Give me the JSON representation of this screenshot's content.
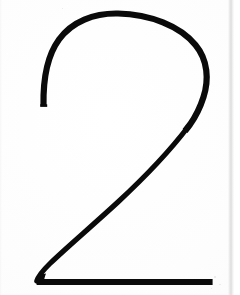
{
  "image": {
    "kind": "scanned-glyph",
    "subject": "numeral-two",
    "character": "2",
    "canvas": {
      "width": 240,
      "height": 295
    },
    "background_color": "#fdfdfd",
    "stroke_color": "#0a0a0a",
    "seam_color": "#dedede",
    "alt_text": "2"
  },
  "glyph": {
    "label": "2",
    "bounds": {
      "left": 36,
      "top": 13,
      "right": 213,
      "bottom": 285
    },
    "stroke_width_top": 6,
    "stroke_width_diagonal": 5,
    "stroke_width_baseline": 6,
    "arc_apex_y": 15,
    "bowl_right_extent_x": 207,
    "left_terminal": {
      "x": 43,
      "y": 105
    },
    "inflection": {
      "x": 200,
      "y": 125
    },
    "baseline": {
      "y": 282,
      "start_x": 36,
      "end_x": 213
    }
  },
  "artifacts": {
    "scan_seam_x": 228,
    "scan_seam_width": 6,
    "right_margin_x": 234,
    "left_edge_width": 2,
    "blur_radius_px": 0.55
  }
}
